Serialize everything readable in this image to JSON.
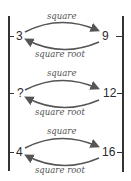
{
  "rows": [
    {
      "left": "3",
      "right": "9",
      "top_label": "square",
      "bottom_label": "square root"
    },
    {
      "left": "?",
      "right": "12",
      "top_label": "square",
      "bottom_label": "square root"
    },
    {
      "left": "4",
      "right": "16",
      "top_label": "square",
      "bottom_label": "square root"
    }
  ],
  "colors": {
    "line": "#333333",
    "arrow": "#555555",
    "text": "#2a2a2a"
  }
}
